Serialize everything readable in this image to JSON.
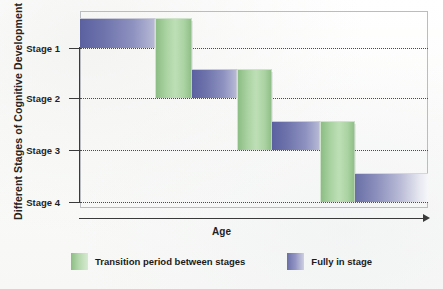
{
  "chart_data": {
    "type": "bar",
    "title": "",
    "subtitle": "",
    "xlabel": "Age",
    "ylabel": "Different Stages of Cognitive Development",
    "grid": true,
    "legend_position": "bottom",
    "ylim": [
      0,
      4
    ],
    "ytick_labels": [
      "Stage 1",
      "Stage 2",
      "Stage 3",
      "Stage 4"
    ],
    "ytick_values": [
      1,
      2,
      3,
      4
    ],
    "xtick_labels": [],
    "series": [
      {
        "name": "Fully in stage",
        "color": "#6a70a8"
      },
      {
        "name": "Transition period between stages",
        "color": "#8cbd84"
      }
    ],
    "segments": [
      {
        "index": 0,
        "series": "Fully in stage",
        "stage": "Stage 1",
        "stage_value": 1,
        "x_start_pct": 0.0,
        "x_end_pct": 21.6,
        "top_pct": 3.6,
        "bottom_pct": 18.8
      },
      {
        "index": 1,
        "series": "Transition period between stages",
        "stage": "Stage 1 to Stage 2",
        "stage_value": 1.5,
        "x_start_pct": 21.6,
        "x_end_pct": 32.2,
        "top_pct": 3.6,
        "bottom_pct": 44.2
      },
      {
        "index": 2,
        "series": "Fully in stage",
        "stage": "Stage 2",
        "stage_value": 2,
        "x_start_pct": 32.2,
        "x_end_pct": 45.1,
        "top_pct": 29.4,
        "bottom_pct": 44.2
      },
      {
        "index": 3,
        "series": "Transition period between stages",
        "stage": "Stage 2 to Stage 3",
        "stage_value": 2.5,
        "x_start_pct": 45.1,
        "x_end_pct": 55.2,
        "top_pct": 29.4,
        "bottom_pct": 70.6
      },
      {
        "index": 4,
        "series": "Fully in stage",
        "stage": "Stage 3",
        "stage_value": 3,
        "x_start_pct": 55.2,
        "x_end_pct": 69.0,
        "top_pct": 55.8,
        "bottom_pct": 70.6
      },
      {
        "index": 5,
        "series": "Transition period between stages",
        "stage": "Stage 3 to Stage 4",
        "stage_value": 3.5,
        "x_start_pct": 69.0,
        "x_end_pct": 79.0,
        "top_pct": 55.8,
        "bottom_pct": 97.0
      },
      {
        "index": 6,
        "series": "Fully in stage",
        "stage": "Stage 4",
        "stage_value": 4,
        "x_start_pct": 79.0,
        "x_end_pct": 100.0,
        "top_pct": 82.2,
        "bottom_pct": 97.0
      }
    ]
  },
  "axes": {
    "y_title": "Different Stages of Cognitive Development",
    "x_title": "Age",
    "y_ticks": [
      {
        "label": "Stage 1",
        "pos_pct": 18.8
      },
      {
        "label": "Stage 2",
        "pos_pct": 44.2
      },
      {
        "label": "Stage 3",
        "pos_pct": 70.6
      },
      {
        "label": "Stage 4",
        "pos_pct": 97.0
      }
    ]
  },
  "legend": {
    "items": [
      {
        "label": "Transition period between stages",
        "swatch": "green-swatch"
      },
      {
        "label": "Fully in stage",
        "swatch": "purple-swatch"
      }
    ]
  }
}
